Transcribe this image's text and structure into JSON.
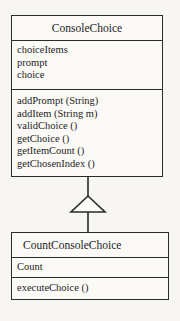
{
  "diagram": {
    "type": "uml-class-diagram",
    "background_color": "#f7f6f2",
    "stroke_color": "#2b2b2b",
    "classes": [
      {
        "name": "ConsoleChoice",
        "role": "superclass",
        "attributes": [
          "choiceItems",
          "prompt",
          "choice"
        ],
        "methods": [
          "addPrompt (String)",
          "addItem (String m)",
          "validChoice ()",
          "getChoice ()",
          "getItemCount ()",
          "getChosenIndex ()"
        ]
      },
      {
        "name": "CountConsoleChoice",
        "role": "subclass",
        "attributes": [
          "Count"
        ],
        "methods": [
          "executeChoice ()"
        ]
      }
    ],
    "relationship": {
      "kind": "generalization",
      "notation": "hollow-triangle-arrowhead",
      "from": "CountConsoleChoice",
      "to": "ConsoleChoice"
    }
  }
}
